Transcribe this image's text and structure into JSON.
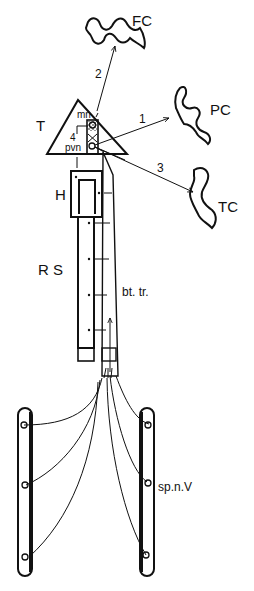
{
  "diagram": {
    "type": "neuroanatomy-schematic",
    "labels": {
      "fc": "FC",
      "pc": "PC",
      "tc": "TC",
      "t": "T",
      "h": "H",
      "rs": "R S",
      "bt_tr": "bt. tr.",
      "sp_n_v": "sp.n.V",
      "mn": "mn",
      "pvn": "pvn",
      "four": "4"
    },
    "arrows": [
      {
        "id": "1",
        "label": "1",
        "from": "T",
        "to": "PC"
      },
      {
        "id": "2",
        "label": "2",
        "from": "T",
        "to": "FC"
      },
      {
        "id": "3",
        "label": "3",
        "from": "T",
        "to": "TC"
      }
    ],
    "colors": {
      "ink": "#111111",
      "background": "#ffffff"
    }
  }
}
